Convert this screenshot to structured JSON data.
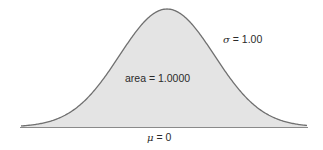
{
  "chart_data": {
    "type": "area",
    "title": "",
    "distribution": "normal",
    "mean": 0,
    "sigma": 1.0,
    "area": 1.0,
    "annotations": {
      "sigma_label": "σ = 1.00",
      "area_label": "area = 1.0000",
      "mu_label": "μ = 0"
    },
    "x_range": [
      -3,
      3
    ],
    "grid": false,
    "fill_color": "#e4e4e4",
    "line_color": "#707070",
    "axis_color": "#808080"
  },
  "labels": {
    "sigma_symbol": "σ",
    "sigma_rest": " = 1.00",
    "area": "area = 1.0000",
    "mu_symbol": "μ",
    "mu_rest": " = 0"
  }
}
